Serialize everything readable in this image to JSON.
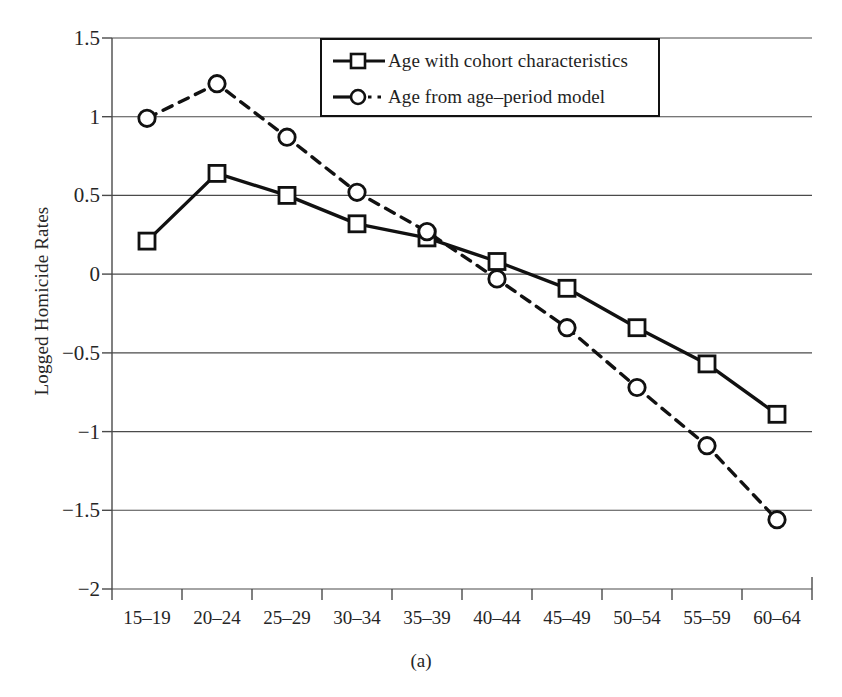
{
  "chart_data": {
    "type": "line",
    "title": "",
    "subtitle": "",
    "caption": "(a)",
    "xlabel": "",
    "ylabel": "Logged Homicide Rates",
    "categories": [
      "15–19",
      "20–24",
      "25–29",
      "30–34",
      "35–39",
      "40–44",
      "45–49",
      "50–54",
      "55–59",
      "60–64"
    ],
    "ylim": [
      -2,
      1.5
    ],
    "yticks": [
      1.5,
      1,
      0.5,
      0,
      -0.5,
      -1,
      -1.5,
      -2
    ],
    "ytick_labels": [
      "1.5",
      "1",
      "0.5",
      "0",
      "−0.5",
      "−1",
      "−1.5",
      "−2"
    ],
    "grid": "horizontal",
    "legend_position": "top-center",
    "series": [
      {
        "name": "Age with cohort characteristics",
        "marker": "square",
        "line_style": "solid",
        "color": "#111111",
        "values": [
          0.21,
          0.64,
          0.5,
          0.32,
          0.23,
          0.08,
          -0.09,
          -0.34,
          -0.57,
          -0.89
        ]
      },
      {
        "name": "Age from age–period model",
        "marker": "circle",
        "line_style": "dashed",
        "color": "#111111",
        "values": [
          0.99,
          1.21,
          0.87,
          0.52,
          0.27,
          -0.03,
          -0.34,
          -0.72,
          -1.09,
          -1.56
        ]
      }
    ]
  },
  "legend": {
    "items": [
      {
        "label": "Age with cohort characteristics",
        "marker": "square",
        "line_style": "solid"
      },
      {
        "label": "Age from age–period model",
        "marker": "circle",
        "line_style": "dashed"
      }
    ]
  },
  "axes": {
    "y_axis_title": "Logged Homicide Rates",
    "caption": "(a)"
  }
}
